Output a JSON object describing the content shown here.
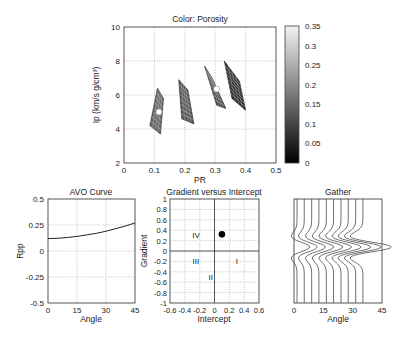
{
  "chart_data": [
    {
      "id": "rock-physics-crossplot",
      "type": "scatter",
      "title": "Color: Porosity",
      "xlabel": "PR",
      "ylabel": "Ip (km/s g/cm³)",
      "xlim": [
        0,
        0.5
      ],
      "ylim": [
        2,
        10
      ],
      "xticks": [
        "0",
        "0.1",
        "0.2",
        "0.3",
        "0.4",
        "0.5"
      ],
      "yticks": [
        "2",
        "4",
        "6",
        "8",
        "10"
      ],
      "grid": true,
      "regions": [
        {
          "name": "cluster-1",
          "polygon": [
            [
              0.11,
              6.4
            ],
            [
              0.13,
              5.8
            ],
            [
              0.12,
              3.7
            ],
            [
              0.085,
              4.2
            ]
          ],
          "fill": "#6a6a6a"
        },
        {
          "name": "cluster-2",
          "polygon": [
            [
              0.18,
              6.9
            ],
            [
              0.21,
              6.3
            ],
            [
              0.23,
              4.3
            ],
            [
              0.19,
              4.6
            ]
          ],
          "fill": "#5a5a5a"
        },
        {
          "name": "cluster-3",
          "polygon": [
            [
              0.265,
              7.7
            ],
            [
              0.29,
              7.0
            ],
            [
              0.335,
              5.2
            ],
            [
              0.305,
              5.4
            ]
          ],
          "fill": "#4a4a4a"
        },
        {
          "name": "cluster-4",
          "polygon": [
            [
              0.33,
              8.0
            ],
            [
              0.38,
              6.8
            ],
            [
              0.4,
              5.1
            ],
            [
              0.355,
              5.8
            ]
          ],
          "fill": "#2e2e2e"
        }
      ],
      "markers": [
        {
          "x": 0.115,
          "y": 5.0,
          "color": "#ffffff"
        },
        {
          "x": 0.305,
          "y": 6.35,
          "color": "#ffffff"
        }
      ],
      "colorbar": {
        "label": "Porosity",
        "min": 0,
        "max": 0.35,
        "ticks": [
          "0",
          "0.05",
          "0.1",
          "0.15",
          "0.2",
          "0.25",
          "0.3",
          "0.35"
        ],
        "colormap": "gray"
      }
    },
    {
      "id": "avo-curve",
      "type": "line",
      "title": "AVO Curve",
      "xlabel": "Angle",
      "ylabel": "Rpp",
      "xlim": [
        0,
        45
      ],
      "ylim": [
        -0.5,
        0.5
      ],
      "xticks": [
        "0",
        "15",
        "30",
        "45"
      ],
      "yticks": [
        "0.5",
        "0.25",
        "0",
        "-0.25",
        "-0.5"
      ],
      "grid": true,
      "series": [
        {
          "name": "Rpp",
          "x": [
            0,
            5,
            10,
            15,
            20,
            25,
            30,
            35,
            40,
            45
          ],
          "values": [
            0.12,
            0.122,
            0.13,
            0.14,
            0.155,
            0.17,
            0.19,
            0.215,
            0.24,
            0.27
          ]
        }
      ]
    },
    {
      "id": "gradient-intercept",
      "type": "scatter",
      "title": "Gradient versus Intercept",
      "xlabel": "Intercept",
      "ylabel": "Gradient",
      "xlim": [
        -0.6,
        0.6
      ],
      "ylim": [
        -1,
        1
      ],
      "xticks": [
        "-0.6",
        "-0.4",
        "-0.2",
        "0",
        "0.2",
        "0.4",
        "0.6"
      ],
      "yticks": [
        "1",
        "0.8",
        "0.6",
        "0.4",
        "0.2",
        "0",
        "-0.2",
        "-0.4",
        "-0.6",
        "-0.8",
        "-1"
      ],
      "grid": true,
      "points": [
        {
          "x": 0.1,
          "y": 0.32,
          "color": "#000000"
        }
      ],
      "annotations": [
        {
          "text": "IV",
          "x": -0.25,
          "y": 0.3
        },
        {
          "text": "III",
          "x": -0.25,
          "y": -0.2
        },
        {
          "text": "I",
          "x": 0.3,
          "y": -0.2
        },
        {
          "text": "II",
          "x": -0.05,
          "y": -0.5
        }
      ]
    },
    {
      "id": "gather",
      "type": "line",
      "title": "Gather",
      "xlabel": "Angle",
      "ylabel": "",
      "xlim": [
        0,
        45
      ],
      "xticks": [
        "0",
        "15",
        "30",
        "45"
      ],
      "grid": false,
      "trace_count": 10,
      "trace_angles": [
        0,
        3.7,
        7.5,
        11.2,
        15,
        18.7,
        22.5,
        26.2,
        30,
        33.7
      ],
      "wavelet_amplitudes": [
        0.12,
        0.122,
        0.13,
        0.14,
        0.155,
        0.17,
        0.19,
        0.215,
        0.24,
        0.27
      ]
    }
  ]
}
